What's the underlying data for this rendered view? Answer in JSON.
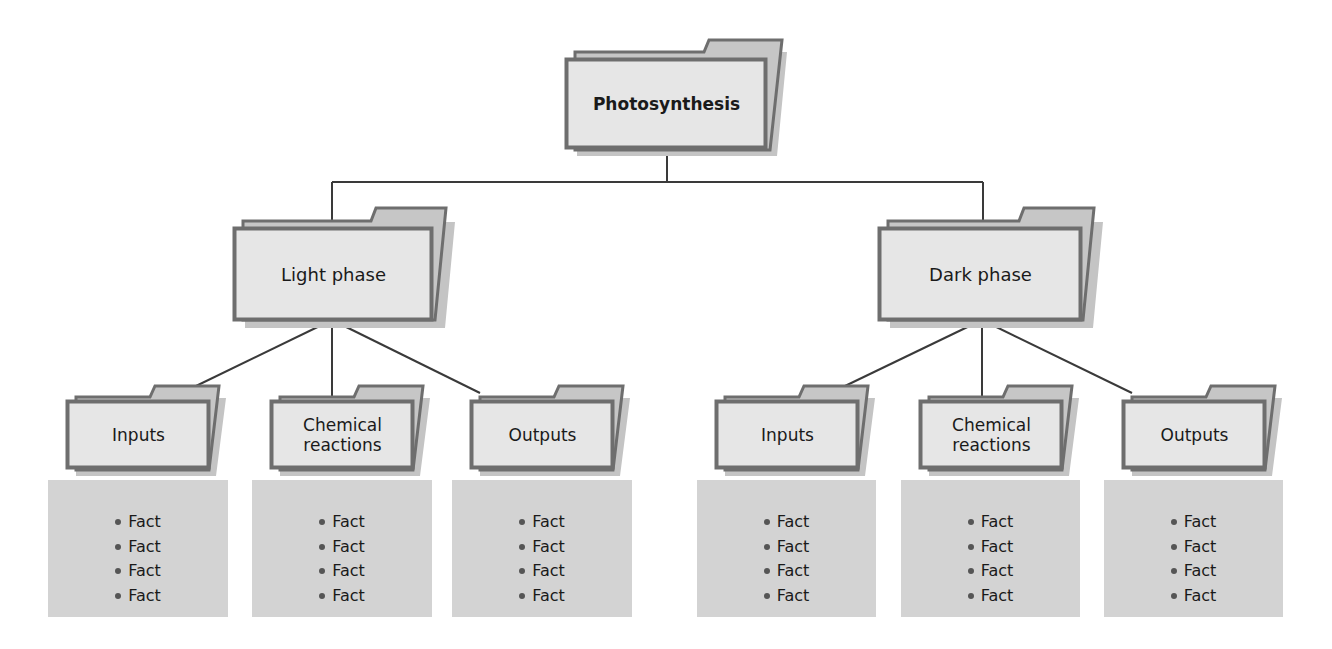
{
  "diagram": {
    "title": "Photosynthesis",
    "colors": {
      "line": "#3a3a3a",
      "folder_border": "#6e6e6e",
      "folder_face": "#e4e4e4",
      "folder_back": "#c6c6c6",
      "folder_shadow": "#bdbdbd",
      "facts_panel": "#d3d3d3"
    },
    "root": {
      "label": "Photosynthesis"
    },
    "branches": [
      {
        "label": "Light phase",
        "children": [
          {
            "label": "Inputs",
            "facts": [
              "Fact",
              "Fact",
              "Fact",
              "Fact"
            ]
          },
          {
            "label": "Chemical reactions",
            "line1": "Chemical",
            "line2": "reactions",
            "facts": [
              "Fact",
              "Fact",
              "Fact",
              "Fact"
            ]
          },
          {
            "label": "Outputs",
            "facts": [
              "Fact",
              "Fact",
              "Fact",
              "Fact"
            ]
          }
        ]
      },
      {
        "label": "Dark phase",
        "children": [
          {
            "label": "Inputs",
            "facts": [
              "Fact",
              "Fact",
              "Fact",
              "Fact"
            ]
          },
          {
            "label": "Chemical reactions",
            "line1": "Chemical",
            "line2": "reactions",
            "facts": [
              "Fact",
              "Fact",
              "Fact",
              "Fact"
            ]
          },
          {
            "label": "Outputs",
            "facts": [
              "Fact",
              "Fact",
              "Fact",
              "Fact"
            ]
          }
        ]
      }
    ]
  }
}
